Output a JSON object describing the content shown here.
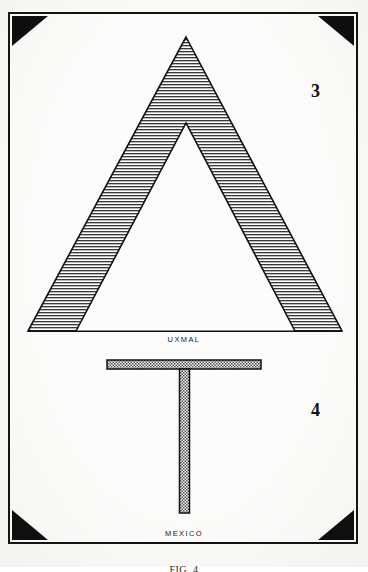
{
  "plate": {
    "background_color": "#fbfaf7",
    "frame_color": "#111111",
    "corner_ornament_color": "#0b0b0b",
    "ink_color": "#1a1a1a",
    "hatch_color": "#3a3a3a",
    "caption": "FIG. 4"
  },
  "figures": [
    {
      "number": "3",
      "caption": "UXMAL",
      "shape": "chevron-hatched-triangle",
      "fill": "horizontal-line-hatch"
    },
    {
      "number": "4",
      "caption": "MEXICO",
      "shape": "tau-cross",
      "fill": "stipple-crosshatch"
    }
  ],
  "corners": [
    {
      "name": "top-left"
    },
    {
      "name": "top-right"
    },
    {
      "name": "bottom-left"
    },
    {
      "name": "bottom-right"
    }
  ]
}
